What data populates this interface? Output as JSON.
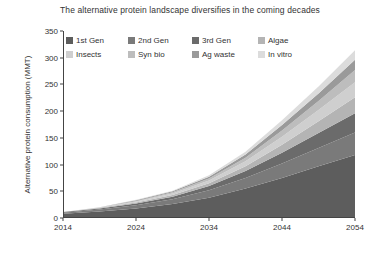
{
  "chart_data": {
    "type": "area",
    "title": "The alternative protein landscape diversifies in the coming decades",
    "xlabel": "",
    "ylabel": "Alternative protein consumption (MMT)",
    "stacked": true,
    "grid": false,
    "legend_position": "top-left-inside",
    "xlim": [
      2014,
      2054
    ],
    "ylim": [
      0,
      350
    ],
    "xticks": [
      "2014",
      "2024",
      "2034",
      "2044",
      "2054"
    ],
    "xtick_values": [
      2014,
      2024,
      2034,
      2044,
      2054
    ],
    "yticks": [
      "0",
      "50",
      "100",
      "150",
      "200",
      "250",
      "300",
      "350"
    ],
    "ytick_values": [
      0,
      50,
      100,
      150,
      200,
      250,
      300,
      350
    ],
    "x": [
      2014,
      2019,
      2024,
      2029,
      2034,
      2039,
      2044,
      2049,
      2054
    ],
    "series": [
      {
        "name": "1st Gen",
        "color": "#5d5d5d",
        "values": [
          8,
          12,
          18,
          26,
          38,
          55,
          75,
          97,
          118
        ]
      },
      {
        "name": "2nd Gen",
        "color": "#7a7a7a",
        "values": [
          2,
          4,
          6,
          9,
          14,
          20,
          27,
          34,
          42
        ]
      },
      {
        "name": "3rd Gen",
        "color": "#6b6b6b",
        "values": [
          1,
          2,
          3,
          5,
          8,
          13,
          20,
          28,
          36
        ]
      },
      {
        "name": "Algae",
        "color": "#b4b4b4",
        "values": [
          0,
          1,
          2,
          3,
          5,
          9,
          15,
          22,
          30
        ]
      },
      {
        "name": "Insects",
        "color": "#cfcfcf",
        "values": [
          0,
          1,
          2,
          3,
          5,
          9,
          15,
          21,
          28
        ]
      },
      {
        "name": "Syn bio",
        "color": "#bdbdbd",
        "values": [
          0,
          0,
          1,
          2,
          4,
          7,
          12,
          17,
          23
        ]
      },
      {
        "name": "Ag waste",
        "color": "#9a9a9a",
        "values": [
          0,
          0,
          1,
          2,
          3,
          6,
          10,
          14,
          19
        ]
      },
      {
        "name": "In vitro",
        "color": "#dcdcdc",
        "values": [
          0,
          0,
          1,
          1,
          3,
          5,
          9,
          13,
          18
        ]
      }
    ],
    "legend_rows": [
      [
        "1st Gen",
        "2nd Gen",
        "3rd Gen",
        "Algae"
      ],
      [
        "Insects",
        "Syn bio",
        "Ag waste",
        "In vitro"
      ]
    ]
  },
  "axis_color": "#444444",
  "text_color": "#333333"
}
